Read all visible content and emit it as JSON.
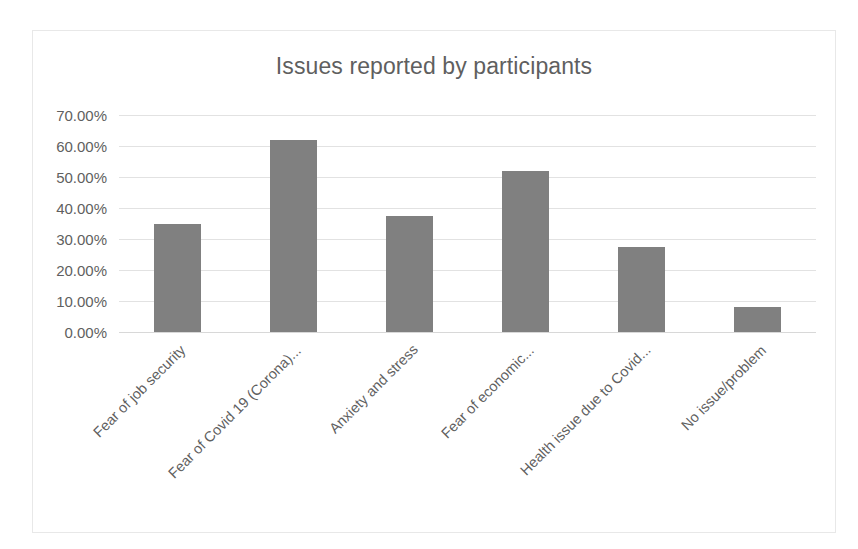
{
  "chart_data": {
    "type": "bar",
    "title": "Issues reported by participants",
    "xlabel": "",
    "ylabel": "",
    "categories": [
      "Fear of job security",
      "Fear of Covid 19 (Corona)...",
      "Anxiety and stress",
      "Fear of economic...",
      "Health issue due to Covid...",
      "No issue/problem"
    ],
    "values": [
      35,
      62,
      37.5,
      52,
      27.5,
      8
    ],
    "ylim": [
      0,
      70
    ],
    "ytick_labels": [
      "70.00%",
      "60.00%",
      "50.00%",
      "40.00%",
      "30.00%",
      "20.00%",
      "10.00%",
      "0.00%"
    ],
    "ytick_values": [
      70,
      60,
      50,
      40,
      30,
      20,
      10,
      0
    ],
    "grid": "horizontal",
    "legend": "none",
    "bar_color": "#808080",
    "gridline_color": "#e2e2e2",
    "text_color": "#5f5f5f",
    "border_color": "#e8e8e8",
    "background_color": "#ffffff",
    "xtick_rotation": -45
  }
}
